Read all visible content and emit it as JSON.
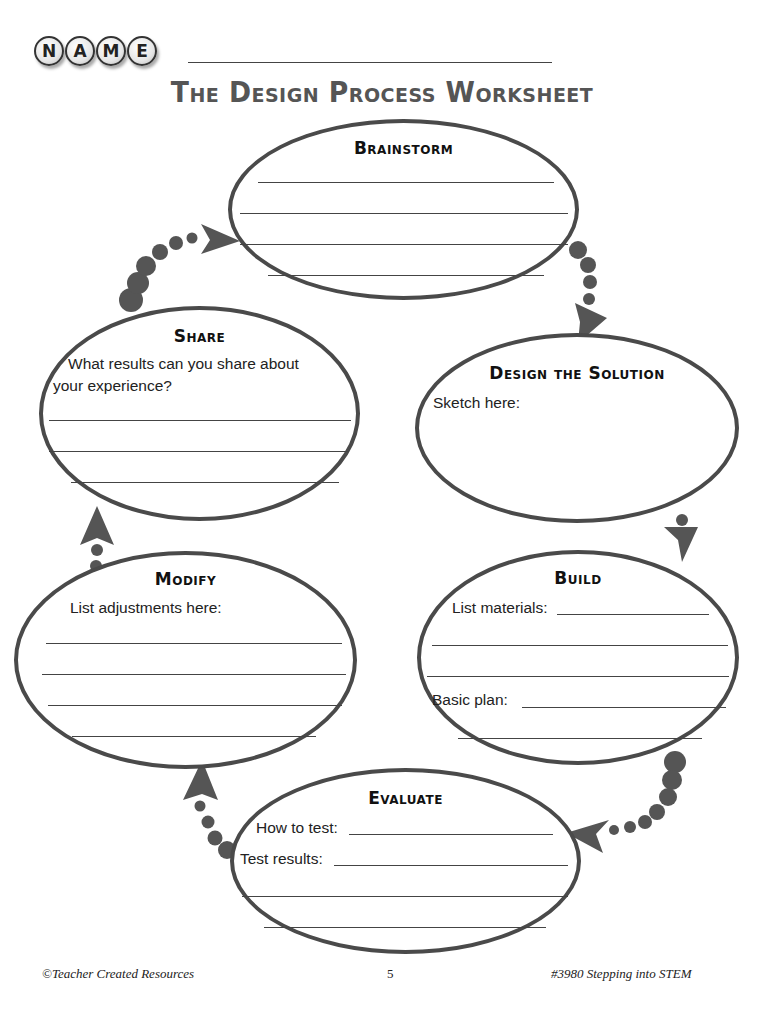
{
  "header": {
    "name_letters": [
      "N",
      "A",
      "M",
      "E"
    ],
    "title": "The Design Process Worksheet"
  },
  "stages": {
    "brainstorm": {
      "title": "Brainstorm",
      "lines": 4
    },
    "design": {
      "title": "Design the Solution",
      "prompt": "Sketch here:"
    },
    "build": {
      "title": "Build",
      "prompt_materials": "List materials:",
      "prompt_plan": "Basic plan:"
    },
    "evaluate": {
      "title": "Evaluate",
      "prompt_how": "How to test:",
      "prompt_results": "Test results:"
    },
    "modify": {
      "title": "Modify",
      "prompt": "List adjustments here:"
    },
    "share": {
      "title": "Share",
      "prompt_line1": "What results can you share about",
      "prompt_line2": "your experience?"
    }
  },
  "flow_order": [
    "Brainstorm",
    "Design the Solution",
    "Build",
    "Evaluate",
    "Modify",
    "Share"
  ],
  "colors": {
    "outline": "#4a4a4a",
    "arrow": "#555555",
    "title": "#555555"
  },
  "footer": {
    "left": "©Teacher Created Resources",
    "center": "5",
    "right": "#3980 Stepping into STEM"
  }
}
